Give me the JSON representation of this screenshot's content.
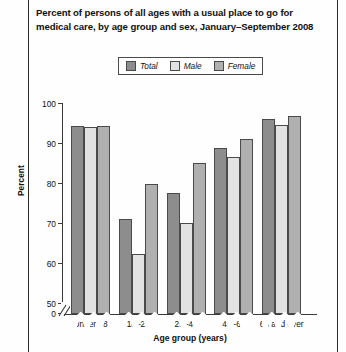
{
  "title": {
    "line1": "Percent of persons of all ages with a usual place to go for",
    "line2": "medical care, by age group and sex, January–September 2008"
  },
  "legend": {
    "items": [
      {
        "label": "Total",
        "color": "#8d8d8d"
      },
      {
        "label": "Male",
        "color": "#e2e2e2"
      },
      {
        "label": "Female",
        "color": "#b0b0b0"
      }
    ]
  },
  "axes": {
    "ylabel": "Percent",
    "xlabel": "Age group (years)",
    "yticks": [
      "0",
      "50",
      "60",
      "70",
      "80",
      "90",
      "100"
    ],
    "break_note": "axis break between 0 and 50"
  },
  "chart_data": {
    "type": "bar",
    "title": "Percent of persons of all ages with a usual place to go for medical care, by age group and sex, January–September 2008",
    "xlabel": "Age group (years)",
    "ylabel": "Percent",
    "ylim": [
      50,
      100
    ],
    "yticks": [
      50,
      60,
      70,
      80,
      90,
      100
    ],
    "axis_break": true,
    "grid": false,
    "legend_position": "top-center",
    "categories": [
      "Under 18",
      "18–24",
      "25–44",
      "45–64",
      "65 and over"
    ],
    "series": [
      {
        "name": "Total",
        "color": "#8d8d8d",
        "values": [
          94.5,
          71.2,
          77.8,
          89.0,
          96.2
        ]
      },
      {
        "name": "Male",
        "color": "#e2e2e2",
        "values": [
          94.3,
          62.4,
          70.2,
          86.8,
          94.8
        ]
      },
      {
        "name": "Female",
        "color": "#b0b0b0",
        "values": [
          94.5,
          80.0,
          85.2,
          91.2,
          97.0
        ]
      }
    ]
  }
}
